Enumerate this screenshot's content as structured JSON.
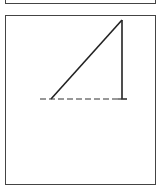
{
  "diagram": {
    "stroke_color": "#222222",
    "border_color": "#444444",
    "shapes": [
      {
        "type": "line",
        "name": "hypotenuse",
        "x1": 51,
        "y1": 99,
        "x2": 122,
        "y2": 20,
        "style": "solid"
      },
      {
        "type": "line",
        "name": "vertical-side",
        "x1": 122,
        "y1": 20,
        "x2": 122,
        "y2": 99,
        "style": "solid"
      },
      {
        "type": "line",
        "name": "base",
        "x1": 40,
        "y1": 99,
        "x2": 130,
        "y2": 99,
        "style": "dashed"
      }
    ]
  }
}
